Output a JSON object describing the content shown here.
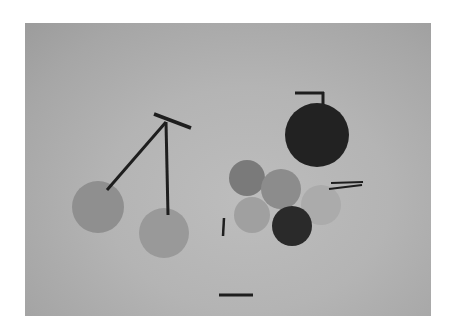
{
  "image": {
    "description": "Grayscale abstract composition of circles and line strokes resembling cherries on a gray board",
    "panel": {
      "x": 25,
      "y": 23,
      "width": 406,
      "height": 293
    },
    "colors": {
      "background_outer": "#ffffff",
      "panel_light": "#bdbdbd",
      "panel_dark": "#9c9c9c",
      "stroke": "#1e1e1e"
    },
    "circles": [
      {
        "name": "left-cherry",
        "cx": 98,
        "cy": 207,
        "r": 26,
        "fill": "#8f8f8f"
      },
      {
        "name": "middle-cherry",
        "cx": 164,
        "cy": 233,
        "r": 25,
        "fill": "#999999"
      },
      {
        "name": "large-dark-circle",
        "cx": 317,
        "cy": 135,
        "r": 32,
        "fill": "#222222"
      },
      {
        "name": "light-back-circle",
        "cx": 321,
        "cy": 205,
        "r": 20,
        "fill": "#ababab"
      },
      {
        "name": "cluster-circle-top-left",
        "cx": 247,
        "cy": 178,
        "r": 18,
        "fill": "#7a7a7a"
      },
      {
        "name": "cluster-circle-center",
        "cx": 281,
        "cy": 189,
        "r": 20,
        "fill": "#8c8c8c"
      },
      {
        "name": "cluster-circle-bottom-left",
        "cx": 252,
        "cy": 215,
        "r": 18,
        "fill": "#a0a0a0"
      },
      {
        "name": "cluster-circle-dark",
        "cx": 292,
        "cy": 226,
        "r": 20,
        "fill": "#2a2a2a"
      }
    ],
    "lines": [
      {
        "name": "cherry-top-bar",
        "x1": 154,
        "y1": 114,
        "x2": 191,
        "y2": 128,
        "w": 3.5
      },
      {
        "name": "cherry-stem-left",
        "x1": 166,
        "y1": 122,
        "x2": 107,
        "y2": 190,
        "w": 3
      },
      {
        "name": "cherry-stem-right",
        "x1": 166,
        "y1": 122,
        "x2": 168,
        "y2": 215,
        "w": 3
      },
      {
        "name": "dark-circle-stem-horizontal",
        "x1": 295,
        "y1": 93,
        "x2": 324,
        "y2": 93,
        "w": 3
      },
      {
        "name": "dark-circle-stem-vertical",
        "x1": 323,
        "y1": 92,
        "x2": 323,
        "y2": 104,
        "w": 3
      },
      {
        "name": "small-vertical-bar",
        "x1": 224,
        "y1": 218,
        "x2": 223,
        "y2": 236,
        "w": 2.5
      },
      {
        "name": "double-line-top",
        "x1": 331,
        "y1": 183,
        "x2": 363,
        "y2": 182,
        "w": 2
      },
      {
        "name": "double-line-bottom",
        "x1": 329,
        "y1": 189,
        "x2": 362,
        "y2": 185,
        "w": 2
      },
      {
        "name": "bottom-horizontal-bar",
        "x1": 219,
        "y1": 295,
        "x2": 253,
        "y2": 295,
        "w": 3
      }
    ]
  }
}
